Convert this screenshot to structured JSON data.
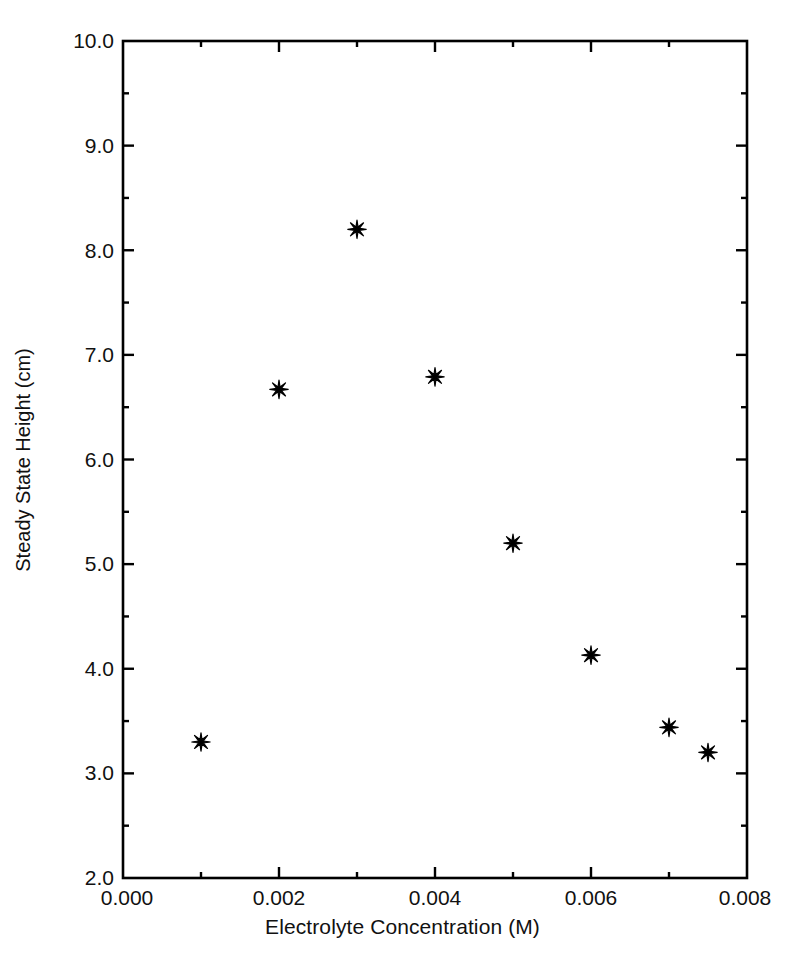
{
  "chart_data": {
    "type": "scatter",
    "title": "",
    "xlabel": "Electrolyte Concentration (M)",
    "ylabel": "Steady State Height (cm)",
    "xlim": [
      0.0,
      0.008
    ],
    "ylim": [
      2.0,
      10.0
    ],
    "grid": false,
    "legend": null,
    "marker": "asterisk",
    "marker_color": "#000000",
    "x_major_step": 0.002,
    "x_minor_step": 0.001,
    "y_major_step": 1.0,
    "y_minor_step": 0.5,
    "xticks": [
      0.0,
      0.002,
      0.004,
      0.006,
      0.008
    ],
    "xticklabels": [
      "0.000",
      "0.002",
      "0.004",
      "0.006",
      "0.008"
    ],
    "yticks": [
      2.0,
      3.0,
      4.0,
      5.0,
      6.0,
      7.0,
      8.0,
      9.0,
      10.0
    ],
    "yticklabels": [
      "2.0",
      "3.0",
      "4.0",
      "5.0",
      "6.0",
      "7.0",
      "8.0",
      "9.0",
      "10.0"
    ],
    "points": [
      {
        "x": 0.001,
        "y": 3.3
      },
      {
        "x": 0.002,
        "y": 6.67
      },
      {
        "x": 0.003,
        "y": 8.2
      },
      {
        "x": 0.004,
        "y": 6.79
      },
      {
        "x": 0.005,
        "y": 5.2
      },
      {
        "x": 0.006,
        "y": 4.13
      },
      {
        "x": 0.007,
        "y": 3.44
      },
      {
        "x": 0.0075,
        "y": 3.2
      }
    ],
    "x": [
      0.001,
      0.002,
      0.003,
      0.004,
      0.005,
      0.006,
      0.007,
      0.0075
    ],
    "values": [
      3.3,
      6.67,
      8.2,
      6.79,
      5.2,
      4.13,
      3.44,
      3.2
    ],
    "axis_color": "#000000",
    "background": "#ffffff"
  }
}
